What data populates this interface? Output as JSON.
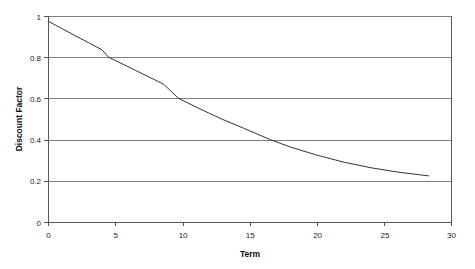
{
  "chart_data": {
    "type": "line",
    "title": "",
    "xlabel": "Term",
    "ylabel": "Discount Factor",
    "xlim": [
      0,
      30
    ],
    "ylim": [
      0,
      1
    ],
    "x_ticks": [
      "0",
      "5",
      "10",
      "15",
      "20",
      "25",
      "30"
    ],
    "x_tick_values": [
      0,
      5,
      10,
      15,
      20,
      25,
      30
    ],
    "y_ticks": [
      "0",
      "0.2",
      "0.4",
      "0.6",
      "0.8",
      "1"
    ],
    "y_tick_values": [
      0,
      0.2,
      0.4,
      0.6,
      0.8,
      1
    ],
    "grid": "horizontal",
    "legend": "none",
    "series": [
      {
        "name": "Discount Factor",
        "color": "#333333",
        "x": [
          0,
          1,
          2,
          3,
          4,
          5,
          6,
          7,
          8,
          9,
          10,
          11,
          12,
          13,
          14,
          15,
          16,
          17,
          18,
          19,
          20,
          21,
          22,
          23,
          24,
          25,
          26,
          27,
          28,
          28.3
        ],
        "values": [
          0.975,
          0.947,
          0.919,
          0.892,
          0.866,
          0.841,
          0.816,
          0.792,
          0.769,
          0.746,
          0.724,
          0.703,
          0.682,
          0.662,
          0.643,
          0.624,
          0.605,
          0.587,
          0.57,
          0.553,
          0.537,
          0.521,
          0.506,
          0.491,
          0.476,
          0.462,
          0.449,
          0.436,
          0.423,
          0.419
        ]
      }
    ],
    "curve_pixel_points": [
      [
        0,
        0.975
      ],
      [
        1.0,
        0.94
      ],
      [
        2.0,
        0.905
      ],
      [
        3.0,
        0.871
      ],
      [
        4.0,
        0.836
      ],
      [
        4.5,
        0.8
      ],
      [
        5.5,
        0.768
      ],
      [
        6.5,
        0.736
      ],
      [
        7.5,
        0.704
      ],
      [
        8.6,
        0.668
      ],
      [
        9.7,
        0.6
      ],
      [
        11.0,
        0.558
      ],
      [
        12.0,
        0.527
      ],
      [
        13.0,
        0.497
      ],
      [
        14.5,
        0.456
      ],
      [
        16.5,
        0.4
      ],
      [
        18.0,
        0.364
      ],
      [
        20.0,
        0.324
      ],
      [
        22.0,
        0.29
      ],
      [
        24.0,
        0.263
      ],
      [
        26.0,
        0.242
      ],
      [
        28.0,
        0.226
      ],
      [
        28.3,
        0.224
      ]
    ],
    "plot_area": {
      "left": 48,
      "top": 16,
      "right": 452,
      "bottom": 222
    }
  },
  "colors": {
    "series_line": "#333333",
    "gridline": "#7f7f7f",
    "axis": "#555555",
    "background": "#ffffff",
    "text": "#1a1a1a"
  }
}
